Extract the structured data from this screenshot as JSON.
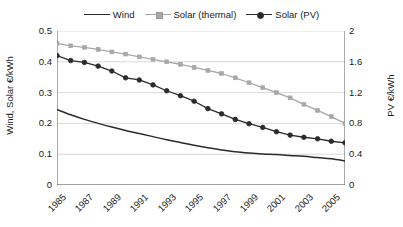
{
  "legend": {
    "position": "top-center",
    "entries": [
      {
        "label": "Wind",
        "marker": "none",
        "color": "#2b2b2b",
        "icon": "line-swatch-icon"
      },
      {
        "label": "Solar (thermal)",
        "marker": "square",
        "color": "#a8a8a8",
        "icon": "line-square-swatch-icon"
      },
      {
        "label": "Solar (PV)",
        "marker": "circle",
        "color": "#2b2b2b",
        "icon": "line-circle-swatch-icon"
      }
    ]
  },
  "axes": {
    "left_title": "Wind, Solar €/kWh",
    "right_title": "PV €/kWh",
    "left_ticks": [
      "0.5",
      "0.4",
      "0.3",
      "0.2",
      "0.1",
      "0"
    ],
    "right_ticks": [
      "2",
      "1.6",
      "1.2",
      "0.8",
      "0.4",
      "0"
    ],
    "x_ticks": [
      "1985",
      "1987",
      "1989",
      "1991",
      "1993",
      "1995",
      "1997",
      "1999",
      "2001",
      "2003",
      "2005"
    ]
  },
  "chart_data": {
    "type": "line",
    "title": "",
    "xlabel": "",
    "ylabel": "Wind, Solar €/kWh",
    "y2label": "PV €/kWh",
    "grid": true,
    "legend_position": "top-center",
    "ylim": [
      0,
      0.5
    ],
    "y2lim": [
      0,
      2
    ],
    "xlim": [
      1985,
      2006
    ],
    "x": [
      1985,
      1986,
      1987,
      1988,
      1989,
      1990,
      1991,
      1992,
      1993,
      1994,
      1995,
      1996,
      1997,
      1998,
      1999,
      2000,
      2001,
      2002,
      2003,
      2004,
      2005,
      2006
    ],
    "series": [
      {
        "name": "Wind",
        "axis": "left",
        "unit": "€/kWh",
        "color": "#2b2b2b",
        "marker": "none",
        "values": [
          0.245,
          0.228,
          0.213,
          0.2,
          0.188,
          0.177,
          0.167,
          0.157,
          0.147,
          0.138,
          0.129,
          0.121,
          0.114,
          0.108,
          0.104,
          0.101,
          0.099,
          0.096,
          0.093,
          0.089,
          0.085,
          0.078
        ]
      },
      {
        "name": "Solar (thermal)",
        "axis": "left",
        "unit": "€/kWh",
        "color": "#a8a8a8",
        "marker": "square",
        "values": [
          0.46,
          0.452,
          0.447,
          0.44,
          0.432,
          0.425,
          0.416,
          0.408,
          0.4,
          0.392,
          0.382,
          0.372,
          0.362,
          0.348,
          0.332,
          0.316,
          0.3,
          0.283,
          0.262,
          0.242,
          0.222,
          0.2
        ]
      },
      {
        "name": "Solar (PV)",
        "axis": "right",
        "unit": "€/kWh",
        "color": "#2b2b2b",
        "marker": "circle",
        "values_left_scale": [
          0.42,
          0.404,
          0.398,
          0.386,
          0.37,
          0.348,
          0.341,
          0.325,
          0.306,
          0.29,
          0.272,
          0.248,
          0.231,
          0.213,
          0.199,
          0.187,
          0.173,
          0.162,
          0.155,
          0.15,
          0.142,
          0.137
        ],
        "values": [
          1.68,
          1.616,
          1.592,
          1.544,
          1.48,
          1.392,
          1.364,
          1.3,
          1.224,
          1.16,
          1.088,
          0.992,
          0.924,
          0.852,
          0.796,
          0.748,
          0.692,
          0.648,
          0.62,
          0.6,
          0.568,
          0.548
        ]
      }
    ]
  },
  "colors": {
    "wind": "#2b2b2b",
    "solar_thermal": "#a8a8a8",
    "solar_pv": "#2b2b2b",
    "grid": "#d0d0d0",
    "axis": "#555555",
    "background": "#ffffff"
  }
}
